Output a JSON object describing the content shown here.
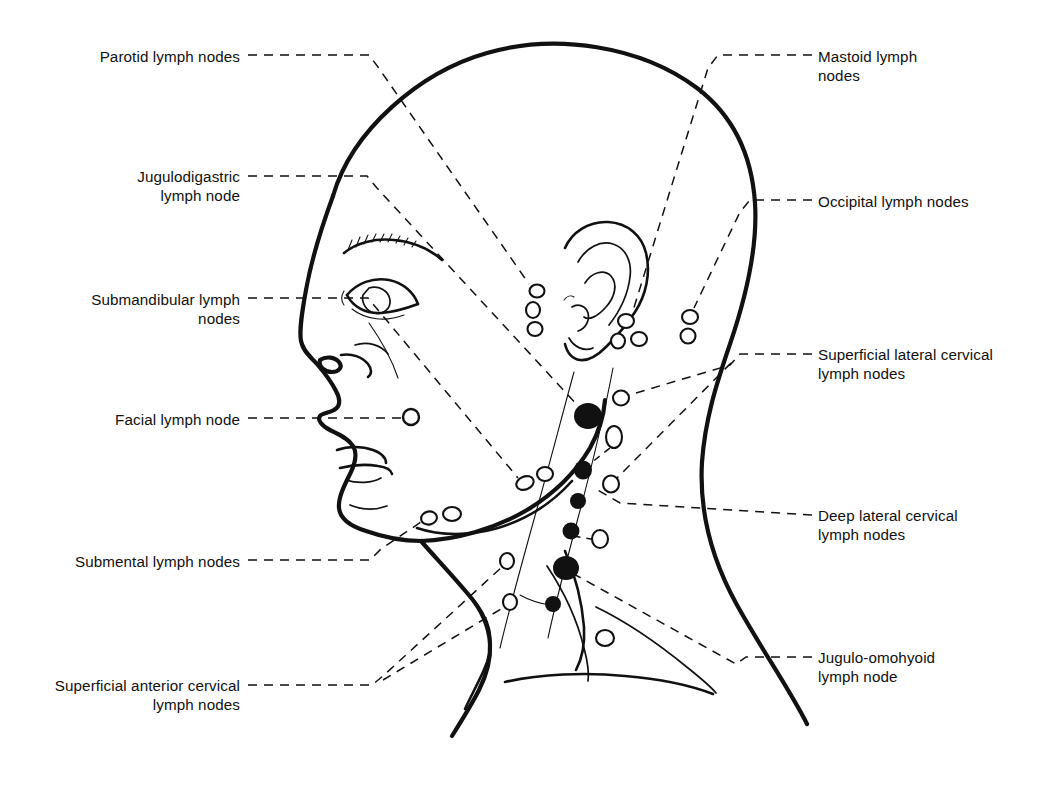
{
  "figure": {
    "type": "anatomical-line-diagram",
    "background_color": "#ffffff",
    "ink_color": "#111111",
    "leader_line_style": "dashed"
  },
  "labels_left": [
    {
      "id": "parotid",
      "text": "Parotid lymph nodes",
      "x": 240,
      "y": 47,
      "align": "right",
      "leader_from": [
        248,
        55
      ],
      "leader_to": [
        536,
        291
      ],
      "node_style": "open"
    },
    {
      "id": "jugulodigastric",
      "text": "Jugulodigastric\nlymph node",
      "x": 240,
      "y": 167,
      "align": "right",
      "leader_from": [
        248,
        176
      ],
      "leader_to": [
        587,
        415
      ],
      "node_style": "solid"
    },
    {
      "id": "submandibular",
      "text": "Submandibular lymph\nnodes",
      "x": 240,
      "y": 290,
      "align": "right",
      "leader_from": [
        248,
        298
      ],
      "leader_to": [
        522,
        483
      ],
      "node_style": "open"
    },
    {
      "id": "facial",
      "text": "Facial lymph node",
      "x": 240,
      "y": 410,
      "align": "right",
      "leader_from": [
        248,
        418
      ],
      "leader_to": [
        404,
        417
      ],
      "node_style": "open"
    },
    {
      "id": "submental",
      "text": "Submental lymph nodes",
      "x": 240,
      "y": 552,
      "align": "right",
      "leader_from": [
        248,
        560
      ],
      "leader_to": [
        428,
        517
      ],
      "node_style": "open"
    },
    {
      "id": "superficial-anterior-cervical",
      "text": "Superficial anterior cervical\nlymph nodes",
      "x": 240,
      "y": 676,
      "align": "right",
      "leader_from": [
        248,
        685
      ],
      "leader_to": [
        505,
        562
      ],
      "node_style": "open"
    }
  ],
  "labels_right": [
    {
      "id": "mastoid",
      "text": "Mastoid lymph\nnodes",
      "x": 818,
      "y": 47,
      "align": "left",
      "leader_from": [
        812,
        55
      ],
      "leader_to": [
        620,
        328
      ],
      "node_style": "open"
    },
    {
      "id": "occipital",
      "text": "Occipital lymph nodes",
      "x": 818,
      "y": 192,
      "align": "left",
      "leader_from": [
        812,
        200
      ],
      "leader_to": [
        690,
        315
      ],
      "node_style": "open"
    },
    {
      "id": "superficial-lateral-cervical",
      "text": "Superficial lateral cervical\nlymph nodes",
      "x": 818,
      "y": 345,
      "align": "left",
      "leader_from": [
        812,
        354
      ],
      "leader_to": [
        618,
        400
      ],
      "node_style": "open"
    },
    {
      "id": "deep-lateral-cervical",
      "text": "Deep lateral cervical\nlymph nodes",
      "x": 818,
      "y": 506,
      "align": "left",
      "leader_from": [
        812,
        515
      ],
      "leader_to": [
        600,
        487
      ],
      "node_style": "open"
    },
    {
      "id": "jugulo-omohyoid",
      "text": "Jugulo-omohyoid\nlymph node",
      "x": 818,
      "y": 648,
      "align": "left",
      "leader_from": [
        812,
        657
      ],
      "leader_to": [
        566,
        568
      ],
      "node_style": "solid"
    }
  ],
  "node_groups": [
    {
      "id": "parotid-nodes",
      "label": "Parotid lymph nodes",
      "style": "open",
      "count": 3,
      "points": [
        [
          537,
          291
        ],
        [
          534,
          309
        ],
        [
          534,
          327
        ]
      ]
    },
    {
      "id": "mastoid-nodes",
      "label": "Mastoid lymph nodes",
      "style": "open",
      "count": 3,
      "points": [
        [
          626,
          322
        ],
        [
          620,
          341
        ],
        [
          640,
          338
        ]
      ]
    },
    {
      "id": "occipital-nodes",
      "label": "Occipital lymph nodes",
      "style": "open",
      "count": 2,
      "points": [
        [
          690,
          317
        ],
        [
          688,
          336
        ]
      ]
    },
    {
      "id": "facial-node",
      "label": "Facial lymph node",
      "style": "open",
      "count": 1,
      "points": [
        [
          410,
          417
        ]
      ]
    },
    {
      "id": "submandibular-nodes",
      "label": "Submandibular lymph nodes",
      "style": "open",
      "count": 2,
      "points": [
        [
          525,
          483
        ],
        [
          545,
          476
        ]
      ]
    },
    {
      "id": "submental-nodes",
      "label": "Submental lymph nodes",
      "style": "open",
      "count": 2,
      "points": [
        [
          428,
          517
        ],
        [
          450,
          514
        ]
      ]
    },
    {
      "id": "superficial-anterior-cervical-nodes",
      "label": "Superficial anterior cervical lymph nodes",
      "style": "open",
      "count": 2,
      "points": [
        [
          506,
          561
        ],
        [
          509,
          602
        ]
      ]
    },
    {
      "id": "superficial-lateral-cervical-nodes",
      "label": "Superficial lateral cervical lymph nodes",
      "style": "open",
      "count": 2,
      "points": [
        [
          620,
          399
        ],
        [
          610,
          484
        ]
      ]
    },
    {
      "id": "deep-lateral-cervical-nodes",
      "label": "Deep lateral cervical lymph nodes",
      "style": "open",
      "count": 3,
      "points": [
        [
          614,
          436
        ],
        [
          601,
          539
        ],
        [
          605,
          638
        ]
      ]
    },
    {
      "id": "deep-cervical-chain",
      "label": "Deep cervical chain (solid nodes)",
      "style": "solid",
      "count": 7,
      "points": [
        [
          587,
          415
        ],
        [
          583,
          470
        ],
        [
          578,
          501
        ],
        [
          570,
          530
        ],
        [
          566,
          568
        ],
        [
          554,
          604
        ],
        [
          553,
          576
        ]
      ]
    }
  ],
  "counts": {
    "total_labels": 11,
    "left_labels": 6,
    "right_labels": 5
  }
}
